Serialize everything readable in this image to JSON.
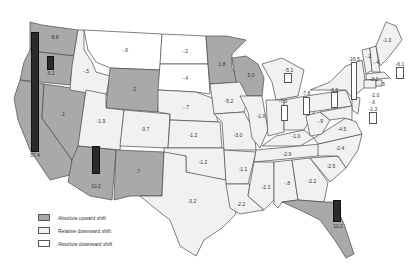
{
  "colors": {
    "absolute_upward": "#a9a9a9",
    "relative_downward": "#f1f1f1",
    "absolute_downward": "#ffffff",
    "bar": "#2b2b2b"
  },
  "legend": {
    "items": [
      {
        "label": "Absolute upward shift",
        "category": "absolute_upward"
      },
      {
        "label": "Relative downward shift",
        "category": "relative_downward"
      },
      {
        "label": "Absolute downward shift",
        "category": "absolute_downward"
      }
    ]
  },
  "states": {
    "WA": {
      "value": "8.8",
      "category": "absolute_upward"
    },
    "OR": {
      "value": "5.1",
      "category": "absolute_upward"
    },
    "CA": {
      "value": "57.4",
      "category": "absolute_upward"
    },
    "NV": {
      "value": ".1",
      "category": "absolute_upward"
    },
    "ID": {
      "value": "-.5",
      "category": "relative_downward"
    },
    "MT": {
      "value": "-.6",
      "category": "absolute_downward"
    },
    "WY": {
      "value": ".2",
      "category": "absolute_upward"
    },
    "UT": {
      "value": "-1.9",
      "category": "relative_downward"
    },
    "CO": {
      "value": "-3.7",
      "category": "relative_downward"
    },
    "AZ": {
      "value": "10.2",
      "category": "absolute_upward"
    },
    "NM": {
      "value": ".7",
      "category": "absolute_upward"
    },
    "ND": {
      "value": "-.2",
      "category": "absolute_downward"
    },
    "SD": {
      "value": "-.4",
      "category": "absolute_downward"
    },
    "NE": {
      "value": "-.7",
      "category": "relative_downward"
    },
    "KS": {
      "value": "-1.2",
      "category": "relative_downward"
    },
    "OK": {
      "value": "-1.2",
      "category": "relative_downward"
    },
    "TX": {
      "value": "-3.2",
      "category": "relative_downward"
    },
    "MN": {
      "value": "1.8",
      "category": "absolute_upward"
    },
    "WI": {
      "value": "5.0",
      "category": "absolute_upward"
    },
    "IA": {
      "value": "-5.2",
      "category": "relative_downward"
    },
    "MO": {
      "value": "-3.0",
      "category": "relative_downward"
    },
    "AR": {
      "value": "-1.1",
      "category": "relative_downward"
    },
    "LA": {
      "value": "-2.2",
      "category": "relative_downward"
    },
    "IL": {
      "value": "-1.0",
      "category": "relative_downward"
    },
    "MI": {
      "value": "-5.1",
      "category": "relative_downward"
    },
    "IN": {
      "value": "-7.0",
      "category": "relative_downward"
    },
    "OH": {
      "value": "-7.8",
      "category": "relative_downward"
    },
    "KY": {
      "value": "-1.0",
      "category": "relative_downward"
    },
    "TN": {
      "value": "-2.9",
      "category": "relative_downward"
    },
    "MS": {
      "value": "-2.3",
      "category": "relative_downward"
    },
    "AL": {
      "value": "-.8",
      "category": "relative_downward"
    },
    "GA": {
      "value": "-2.2",
      "category": "relative_downward"
    },
    "FL": {
      "value": "10.2",
      "category": "absolute_upward"
    },
    "SC": {
      "value": "-2.5",
      "category": "relative_downward"
    },
    "NC": {
      "value": "-2.4",
      "category": "relative_downward"
    },
    "VA": {
      "value": "-4.5",
      "category": "relative_downward"
    },
    "WV": {
      "value": "-.9",
      "category": "relative_downward"
    },
    "PA": {
      "value": "-6.6",
      "category": "relative_downward"
    },
    "NY": {
      "value": "-16.5",
      "category": "relative_downward"
    },
    "NJ": {
      "value": "-2.0",
      "category": "relative_downward"
    },
    "DE": {
      "value": "-.6",
      "category": "relative_downward"
    },
    "MD": {
      "value": "-1.3",
      "category": "relative_downward"
    },
    "ME": {
      "value": "-1.0",
      "category": "relative_downward"
    },
    "NH": {
      "value": "-.2",
      "category": "relative_downward"
    },
    "VT": {
      "value": "-.4",
      "category": "relative_downward"
    },
    "MA": {
      "value": "-6.1",
      "category": "relative_downward"
    },
    "CT": {
      "value": "-3.1",
      "category": "relative_downward"
    },
    "RI": {
      "value": "-.5",
      "category": "relative_downward"
    }
  }
}
